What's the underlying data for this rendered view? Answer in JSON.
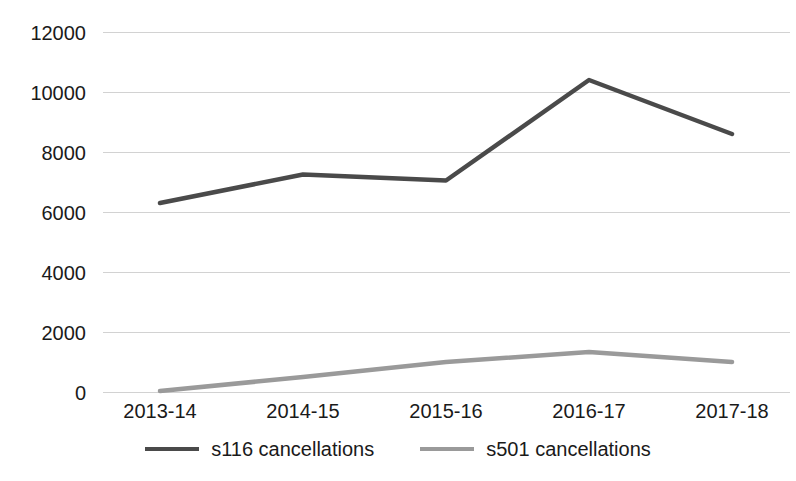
{
  "chart_data": {
    "type": "line",
    "title": "",
    "subtitle": "",
    "xlabel": "",
    "ylabel": "",
    "categories": [
      "2013-14",
      "2014-15",
      "2015-16",
      "2016-17",
      "2017-18"
    ],
    "series": [
      {
        "name": "s116 cancellations",
        "color": "#4a4a4a",
        "values": [
          6300,
          7250,
          7050,
          10400,
          8600
        ]
      },
      {
        "name": "s501 cancellations",
        "color": "#9a9a9a",
        "values": [
          30,
          500,
          1000,
          1330,
          1000
        ]
      }
    ],
    "ylim": [
      0,
      12000
    ],
    "y_ticks": [
      0,
      2000,
      4000,
      6000,
      8000,
      10000,
      12000
    ],
    "y_tick_labels": [
      "0",
      "2000",
      "4000",
      "6000",
      "8000",
      "10000",
      "12000"
    ],
    "grid": true,
    "legend_position": "bottom",
    "gridline_color": "#d2d2d2",
    "background_color": "#ffffff",
    "annotations": []
  },
  "legend": {
    "entries": [
      {
        "label": "s116 cancellations",
        "color": "#4a4a4a"
      },
      {
        "label": "s501 cancellations",
        "color": "#9a9a9a"
      }
    ]
  }
}
